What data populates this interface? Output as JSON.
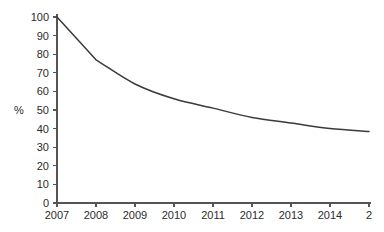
{
  "chart_data": {
    "type": "line",
    "title": "",
    "subtitle": "",
    "xlabel": "",
    "ylabel": "%",
    "x": [
      2007,
      2008,
      2009,
      2010,
      2011,
      2012,
      2013,
      2014,
      2015
    ],
    "categories": [
      "2007",
      "2008",
      "2009",
      "2010",
      "2011",
      "2012",
      "2013",
      "2014",
      "2"
    ],
    "values": [
      100,
      77,
      64,
      56,
      51,
      46,
      43,
      40,
      38.5
    ],
    "series": [
      {
        "name": "",
        "values": [
          100,
          77,
          64,
          56,
          51,
          46,
          43,
          40,
          38.5
        ]
      }
    ],
    "xlim": [
      2007,
      2015
    ],
    "ylim": [
      0,
      100
    ],
    "ytick_labels": [
      "0",
      "10",
      "20",
      "30",
      "40",
      "50",
      "60",
      "70",
      "80",
      "90",
      "100"
    ],
    "ytick_values": [
      0,
      10,
      20,
      30,
      40,
      50,
      60,
      70,
      80,
      90,
      100
    ],
    "xtick_labels": [
      "2007",
      "2008",
      "2009",
      "2010",
      "2011",
      "2012",
      "2013",
      "2014",
      "2"
    ],
    "xtick_values": [
      2007,
      2008,
      2009,
      2010,
      2011,
      2012,
      2013,
      2014,
      2015
    ],
    "last_xtick_truncated": true,
    "grid": false,
    "legend": false,
    "legend_position": "none",
    "annotations": [],
    "line_color": "#3a3a3a",
    "axis_color": "#555555",
    "text_color": "#2b2b2b",
    "background_color": "#ffffff"
  },
  "axes": {
    "y_title": "%",
    "y_ticks": [
      {
        "label": "100",
        "value": 100
      },
      {
        "label": "90",
        "value": 90
      },
      {
        "label": "80",
        "value": 80
      },
      {
        "label": "70",
        "value": 70
      },
      {
        "label": "60",
        "value": 60
      },
      {
        "label": "50",
        "value": 50
      },
      {
        "label": "40",
        "value": 40
      },
      {
        "label": "30",
        "value": 30
      },
      {
        "label": "20",
        "value": 20
      },
      {
        "label": "10",
        "value": 10
      },
      {
        "label": "0",
        "value": 0
      }
    ],
    "x_ticks": [
      {
        "label": "2007",
        "value": 2007
      },
      {
        "label": "2008",
        "value": 2008
      },
      {
        "label": "2009",
        "value": 2009
      },
      {
        "label": "2010",
        "value": 2010
      },
      {
        "label": "2011",
        "value": 2011
      },
      {
        "label": "2012",
        "value": 2012
      },
      {
        "label": "2013",
        "value": 2013
      },
      {
        "label": "2014",
        "value": 2014
      },
      {
        "label": "2",
        "value": 2015
      }
    ]
  }
}
